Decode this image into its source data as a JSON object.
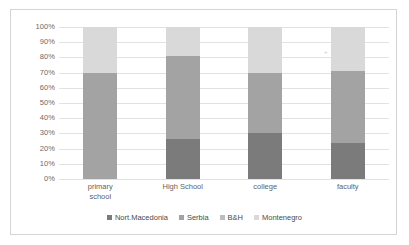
{
  "chart_data": {
    "type": "bar",
    "subtype": "stacked-100-percent",
    "title": "",
    "xlabel": "",
    "ylabel": "",
    "ylim": [
      0,
      100
    ],
    "ytick_labels": [
      "100%",
      "90%",
      "80%",
      "70%",
      "60%",
      "50%",
      "40%",
      "30%",
      "20%",
      "10%",
      "0%"
    ],
    "ytick_values": [
      100,
      90,
      80,
      70,
      60,
      50,
      40,
      30,
      20,
      10,
      0
    ],
    "grid": true,
    "legend_position": "bottom",
    "categories": [
      "primary school",
      "High School",
      "college",
      "faculty"
    ],
    "category_lines": [
      [
        "primary",
        "school"
      ],
      [
        "High School"
      ],
      [
        "college"
      ],
      [
        "faculty"
      ]
    ],
    "series": [
      {
        "name": "Nort.Macedonia",
        "color": "#7b7b7b",
        "values": [
          0,
          26,
          30,
          24
        ]
      },
      {
        "name": "Serbia",
        "color": "#a3a3a3",
        "values": [
          70,
          55,
          40,
          47
        ]
      },
      {
        "name": "B&H",
        "color": "#bdbdbd",
        "values": [
          0,
          0,
          0,
          0
        ]
      },
      {
        "name": "Montenegro",
        "color": "#d9d9d9",
        "values": [
          30,
          19,
          30,
          29
        ]
      }
    ]
  },
  "legend": {
    "items": [
      {
        "label": "Nort.Macedonia"
      },
      {
        "label": "Serbia"
      },
      {
        "label": "B&H"
      },
      {
        "label": "Montenegro"
      }
    ]
  },
  "marks": {
    "stray": "+"
  }
}
